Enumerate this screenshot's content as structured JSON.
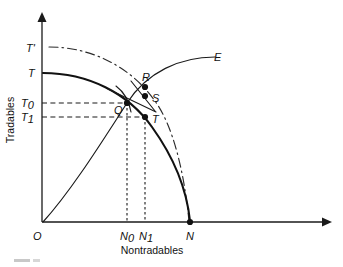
{
  "figure": {
    "kind": "economics-diagram"
  },
  "axes": {
    "y_title": "Tradables",
    "x_title": "Nontradables",
    "origin_label": "O",
    "y_ticks": [
      {
        "id": "T-prime",
        "label": "T",
        "sup": "'",
        "y": 48
      },
      {
        "id": "T",
        "label": "T",
        "sup": "",
        "y": 73
      },
      {
        "id": "T0",
        "label": "T",
        "sub": "0",
        "y": 103
      },
      {
        "id": "T1",
        "label": "T",
        "sub": "1",
        "y": 117
      }
    ],
    "x_ticks": [
      {
        "id": "N0",
        "label": "N",
        "sub": "0",
        "x": 127
      },
      {
        "id": "N1",
        "label": "N",
        "sub": "1",
        "x": 145
      },
      {
        "id": "N",
        "label": "N",
        "sub": "",
        "x": 190
      }
    ]
  },
  "curves": [
    {
      "id": "ppf",
      "name": "production-possibility-frontier",
      "style": "solid"
    },
    {
      "id": "ppf-shift",
      "name": "shifted-production-possibility-frontier",
      "style": "dash-dot"
    },
    {
      "id": "expansion-path",
      "name": "expansion-path",
      "style": "solid",
      "end_label": "E"
    },
    {
      "id": "indifference-arc",
      "name": "indifference-curve",
      "style": "solid"
    },
    {
      "id": "budget-line",
      "name": "relative-price-line",
      "style": "solid"
    }
  ],
  "points": [
    {
      "id": "Q",
      "label": "Q",
      "x": 127,
      "y": 103,
      "label_dx": -11,
      "label_dy": 10
    },
    {
      "id": "R",
      "label": "R",
      "x": 145,
      "y": 87,
      "label_dx": -1,
      "label_dy": -5
    },
    {
      "id": "S",
      "label": "S",
      "x": 145,
      "y": 95,
      "label_dx": 6,
      "label_dy": 7
    },
    {
      "id": "T",
      "label": "T",
      "x": 145,
      "y": 117,
      "label_dx": 6,
      "label_dy": 6
    },
    {
      "id": "N",
      "label": "N",
      "x": 190,
      "y": 222,
      "label_dx": 0,
      "label_dy": 0
    }
  ]
}
